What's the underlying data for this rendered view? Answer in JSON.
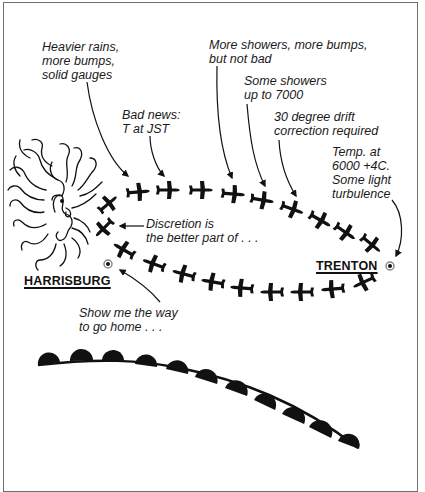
{
  "annotations": [
    {
      "id": "heavier-rains",
      "text": "Heavier rains,\nmore bumps,\nsolid gauges",
      "x": 42,
      "y": 40
    },
    {
      "id": "bad-news",
      "text": "Bad news:\nT at JST",
      "x": 122,
      "y": 108
    },
    {
      "id": "more-showers",
      "text": "More showers, more bumps,\nbut not bad",
      "x": 209,
      "y": 38
    },
    {
      "id": "some-showers",
      "text": "Some showers\nup to 7000",
      "x": 244,
      "y": 74
    },
    {
      "id": "drift-correction",
      "text": "30 degree drift\ncorrection required",
      "x": 274,
      "y": 110
    },
    {
      "id": "temp",
      "text": "Temp. at\n6000 +4C.\nSome light\nturbulence",
      "x": 332,
      "y": 145
    },
    {
      "id": "discretion",
      "text": "Discretion is\nthe better part of . . .",
      "x": 146,
      "y": 217
    },
    {
      "id": "show-me",
      "text": "Show me the way\nto go home . . .",
      "x": 79,
      "y": 306
    }
  ],
  "cities": [
    {
      "id": "harrisburg",
      "name": "HARRISBURG",
      "x": 24,
      "y": 274,
      "dot": [
        108,
        264
      ]
    },
    {
      "id": "trenton",
      "name": "TRENTON",
      "x": 316,
      "y": 259,
      "dot": [
        390,
        266
      ]
    }
  ],
  "colors": {
    "ink": "#111111",
    "frame": "#6e6e6e",
    "background": "#ffffff"
  }
}
